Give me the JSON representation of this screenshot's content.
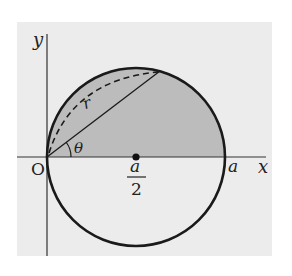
{
  "diagram": {
    "colors": {
      "background_panel": "#ececec",
      "shaded_region": "#bcbcbc",
      "stroke": "#1a1a1a"
    },
    "labels": {
      "y_axis": "y",
      "x_axis": "x",
      "origin": "O",
      "angle": "θ",
      "radius_vector": "r",
      "center_numerator": "a",
      "center_denominator": "2",
      "x_intercept": "a"
    },
    "geometry": {
      "origin_px": [
        47,
        157
      ],
      "center_px": [
        136,
        157
      ],
      "radius_px": 89,
      "chord_end_px": [
        160,
        71
      ]
    }
  }
}
